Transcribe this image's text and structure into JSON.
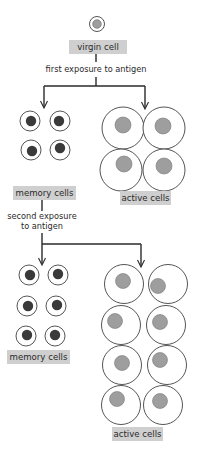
{
  "diagram": {
    "colors": {
      "line": "#2a2a2a",
      "label_bg": "#cfcfcf",
      "memory_nucleus": "#3a3a3a",
      "active_nucleus": "#9e9e9e",
      "cell_outline": "#555555"
    },
    "nodes": {
      "virgin_cell": {
        "label": "virgin cell"
      },
      "first_exposure": {
        "label": "first exposure to antigen"
      },
      "memory_cells_1": {
        "label": "memory cells",
        "count": 4
      },
      "active_cells_1": {
        "label": "active cells",
        "count": 4
      },
      "second_exposure": {
        "label_line1": "second exposure",
        "label_line2": "to antigen"
      },
      "memory_cells_2": {
        "label": "memory cells",
        "count": 6
      },
      "active_cells_2": {
        "label": "active cells",
        "count": 8
      }
    },
    "edges": [
      {
        "from": "virgin cell",
        "to": "memory cells",
        "via": "first exposure to antigen"
      },
      {
        "from": "virgin cell",
        "to": "active cells",
        "via": "first exposure to antigen"
      },
      {
        "from": "memory cells",
        "to": "memory cells",
        "via": "second exposure to antigen"
      },
      {
        "from": "memory cells",
        "to": "active cells",
        "via": "second exposure to antigen"
      }
    ]
  }
}
